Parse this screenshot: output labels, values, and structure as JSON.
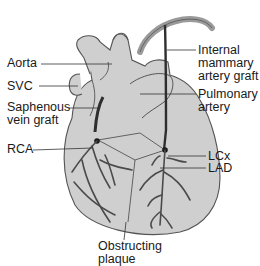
{
  "diagram": {
    "type": "anatomical illustration",
    "colors": {
      "heart_fill": "#cfcfcf",
      "heart_outline": "#555555",
      "vessel": "#4a4a4a",
      "graft": "#2e2e2e",
      "leader_line": "#333333",
      "text": "#1a1a1a",
      "background": "#ffffff"
    },
    "labels": {
      "aorta": "Aorta",
      "svc": "SVC",
      "saphenous_line1": "Saphenous",
      "saphenous_line2": "vein graft",
      "rca": "RCA",
      "internal_line1": "Internal",
      "internal_line2": "mammary",
      "internal_line3": "artery graft",
      "pulmonary_line1": "Pulmonary",
      "pulmonary_line2": "artery",
      "lcx": "LCx",
      "lad": "LAD",
      "obstructing_line1": "Obstructing",
      "obstructing_line2": "plaque"
    }
  }
}
